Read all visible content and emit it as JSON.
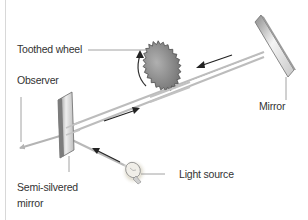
{
  "diagram": {
    "labels": {
      "toothed_wheel": "Toothed wheel",
      "observer": "Observer",
      "mirror": "Mirror",
      "light_source": "Light source",
      "semi_silvered_line1": "Semi-silvered",
      "semi_silvered_line2": "mirror"
    },
    "colors": {
      "beam": "#b4b4b4",
      "arrow": "#222222",
      "leader": "#8a8a8a",
      "wheel": "#8e8e8e",
      "label_text": "#333333"
    }
  }
}
